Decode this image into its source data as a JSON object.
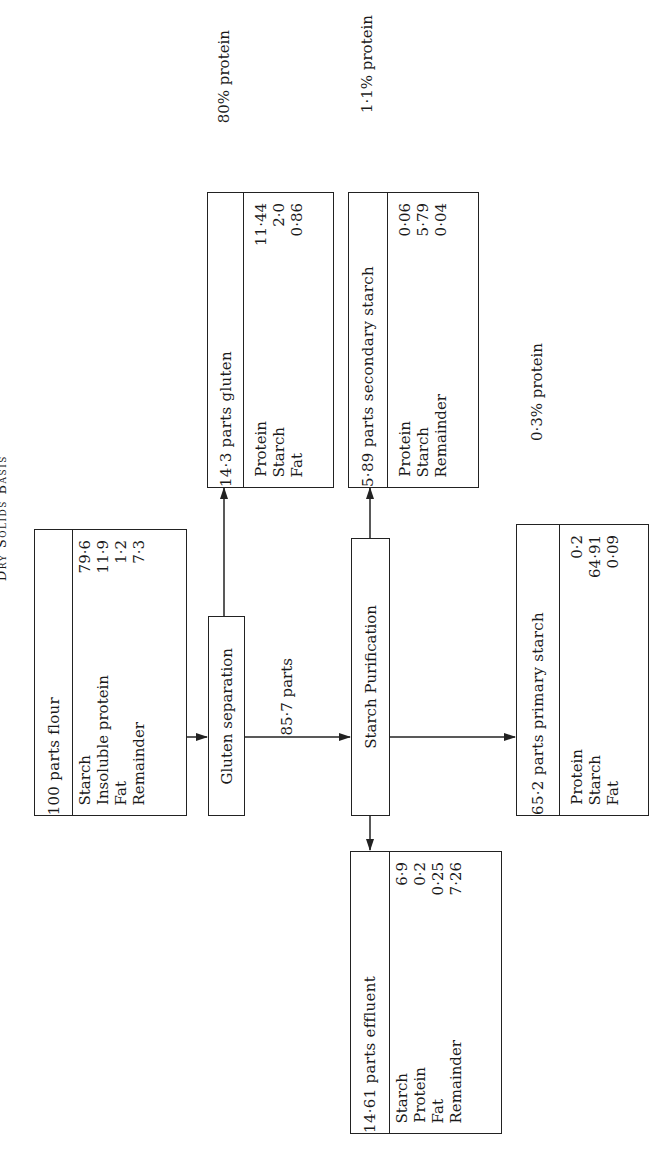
{
  "title": "Dry Solids Basis",
  "nodes": {
    "flour": {
      "header": "100 parts flour",
      "rows": [
        {
          "label": "Starch",
          "value": "79·6"
        },
        {
          "label": "Insoluble protein",
          "value": "11·9"
        },
        {
          "label": "Fat",
          "value": "1·2"
        },
        {
          "label": "Remainder",
          "value": "7·3"
        }
      ]
    },
    "gluten_separation": {
      "label": "Gluten separation"
    },
    "starch_purification": {
      "label": "Starch Purification"
    },
    "gluten": {
      "header": "14·3 parts gluten",
      "rows": [
        {
          "label": "Protein",
          "value": "11·44"
        },
        {
          "label": "Starch",
          "value": "2·0"
        },
        {
          "label": "Fat",
          "value": "0·86"
        }
      ],
      "note": "80% protein"
    },
    "secondary_starch": {
      "header": "5·89 parts secondary starch",
      "rows": [
        {
          "label": "Protein",
          "value": "0·06"
        },
        {
          "label": "Starch",
          "value": "5·79"
        },
        {
          "label": "Remainder",
          "value": "0·04"
        }
      ],
      "note": "1·1% protein"
    },
    "primary_starch": {
      "header": "65·2 parts primary starch",
      "rows": [
        {
          "label": "Protein",
          "value": "0·2"
        },
        {
          "label": "Starch",
          "value": "64·91"
        },
        {
          "label": "Fat",
          "value": "0·09"
        }
      ],
      "note": "0·3% protein"
    },
    "effluent": {
      "header": "14·61 parts effluent",
      "rows": [
        {
          "label": "Starch",
          "value": "6·9"
        },
        {
          "label": "Protein",
          "value": "0·2"
        },
        {
          "label": "Fat",
          "value": "0·25"
        },
        {
          "label": "Remainder",
          "value": "7·26"
        }
      ]
    }
  },
  "flows": [
    {
      "from": "flour",
      "to": "gluten_separation"
    },
    {
      "from": "gluten_separation",
      "to": "gluten"
    },
    {
      "from": "gluten_separation",
      "to": "starch_purification",
      "label": "85·7 parts"
    },
    {
      "from": "starch_purification",
      "to": "secondary_starch"
    },
    {
      "from": "starch_purification",
      "to": "primary_starch"
    },
    {
      "from": "starch_purification",
      "to": "effluent"
    }
  ]
}
